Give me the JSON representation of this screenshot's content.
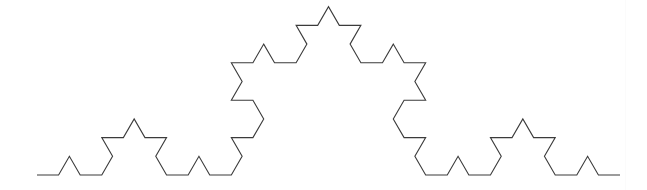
{
  "figure": {
    "kind": "fractal-curve",
    "background_color": "#ffffff",
    "stroke_color": "#3b3b3b",
    "stroke_width": 1.1,
    "canvas": {
      "width": 647,
      "height": 190
    }
  },
  "chart_data": {
    "type": "line",
    "subtitle": "",
    "xlabel": "",
    "ylabel": "",
    "grid": false,
    "legend": "none",
    "annotations": [],
    "fractal": {
      "name": "Koch curve",
      "iterations": 3,
      "initiator": "line segment",
      "generator_angles_deg": [
        0,
        60,
        -120,
        60
      ],
      "segment_count": 64,
      "base_divisions": 27,
      "start_point": [
        37,
        175
      ],
      "end_point": [
        620,
        175
      ],
      "base_length_px": 583,
      "segment_length_px": 21.59,
      "apex_point": [
        330.5,
        7
      ],
      "apex_height_px": 168.3,
      "second_level_peak_height_px": 56.1,
      "third_level_peak_height_px": 18.7,
      "baseline_y": 175
    },
    "xlim": [
      0,
      647
    ],
    "ylim": [
      0,
      190
    ]
  }
}
